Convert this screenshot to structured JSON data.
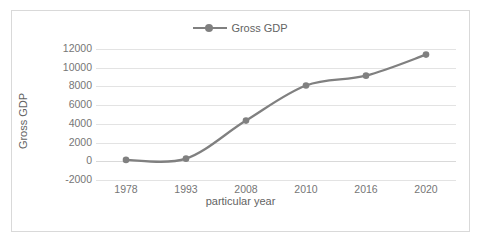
{
  "chart_data": {
    "type": "line",
    "title": "",
    "xlabel": "particular year",
    "ylabel": "Gross GDP",
    "categories": [
      "1978",
      "1993",
      "2008",
      "2010",
      "2016",
      "2020"
    ],
    "series": [
      {
        "name": "Gross GDP",
        "values": [
          150,
          280,
          4350,
          8100,
          9150,
          11400
        ],
        "color": "#808080",
        "marker": "circle"
      }
    ],
    "ylim": [
      -2000,
      12000
    ],
    "ytick_labels": [
      "12000",
      "10000",
      "8000",
      "6000",
      "4000",
      "2000",
      "0",
      "-2000"
    ],
    "ytick_values": [
      12000,
      10000,
      8000,
      6000,
      4000,
      2000,
      0,
      -2000
    ],
    "grid": true,
    "legend": {
      "position": "top-center",
      "entries": [
        "Gross GDP"
      ]
    },
    "plot_border": true
  },
  "colors": {
    "series": "#808080",
    "gridline": "#e3e3e3",
    "text": "#767676",
    "axis_title": "#636363",
    "border": "#d9d9d9",
    "background": "#ffffff"
  }
}
